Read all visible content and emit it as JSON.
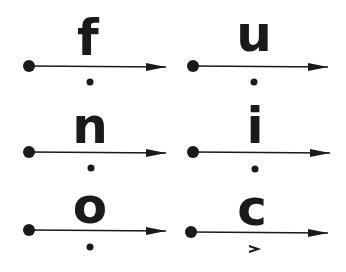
{
  "diagram": {
    "cells": [
      {
        "letter": "f",
        "marker": "dot",
        "col": 0,
        "row": 0
      },
      {
        "letter": "u",
        "marker": "dot",
        "col": 1,
        "row": 0
      },
      {
        "letter": "n",
        "marker": "dot",
        "col": 0,
        "row": 1
      },
      {
        "letter": "i",
        "marker": "dot",
        "col": 1,
        "row": 1
      },
      {
        "letter": "o",
        "marker": "dot",
        "col": 0,
        "row": 2
      },
      {
        "letter": "c",
        "marker": "chevron",
        "col": 1,
        "row": 2
      }
    ],
    "colors": {
      "ink": "#1a1a1a",
      "background": "#ffffff"
    }
  }
}
